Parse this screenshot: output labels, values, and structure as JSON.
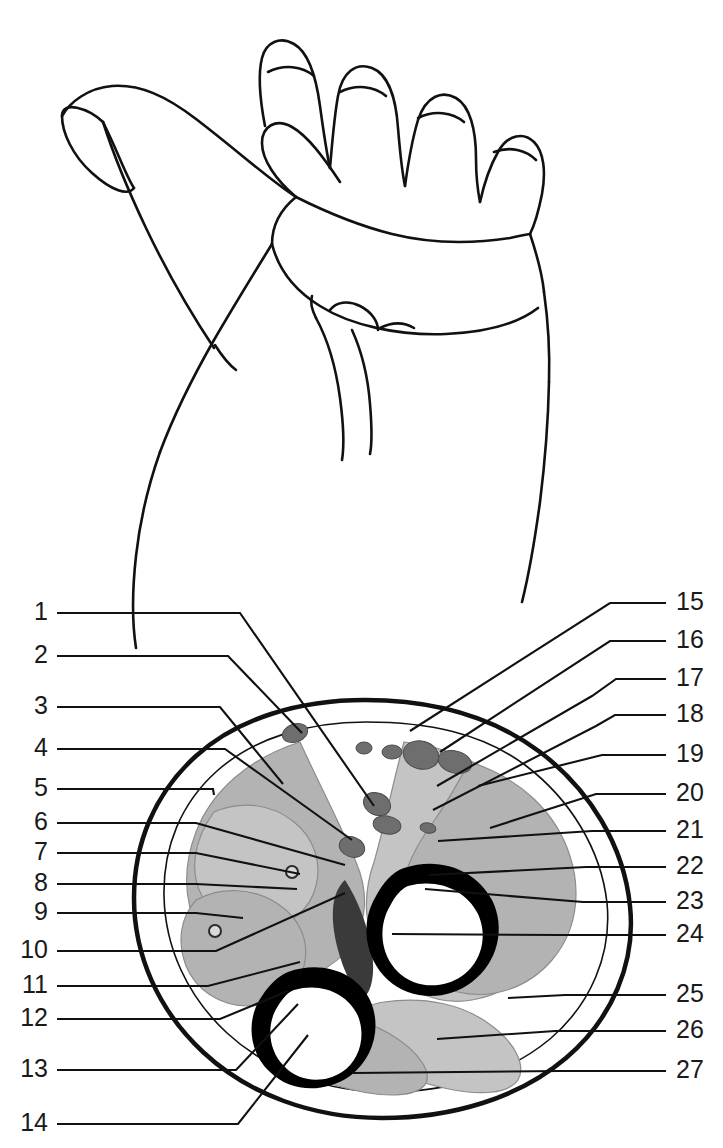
{
  "figure": {
    "view": "palmar hand and forearm with transverse section",
    "background_color": "#ffffff",
    "ink_color": "#111111",
    "muscle_fill_color": "#b3b3b3",
    "muscle_fill_light_color": "#c4c4c4",
    "vessel_fill_color": "#6e6e6e",
    "bone_cortex_color": "#000000",
    "marrow_color": "#ffffff"
  },
  "labels": {
    "left": [
      {
        "id": "1",
        "text": "1",
        "y": 620
      },
      {
        "id": "2",
        "text": "2",
        "y": 663
      },
      {
        "id": "3",
        "text": "3",
        "y": 714
      },
      {
        "id": "4",
        "text": "4",
        "y": 756
      },
      {
        "id": "5",
        "text": "5",
        "y": 796
      },
      {
        "id": "6",
        "text": "6",
        "y": 830
      },
      {
        "id": "7",
        "text": "7",
        "y": 860
      },
      {
        "id": "8",
        "text": "8",
        "y": 891
      },
      {
        "id": "9",
        "text": "9",
        "y": 920
      },
      {
        "id": "10",
        "text": "10",
        "y": 958
      },
      {
        "id": "11",
        "text": "11",
        "y": 993
      },
      {
        "id": "12",
        "text": "12",
        "y": 1026
      },
      {
        "id": "13",
        "text": "13",
        "y": 1077
      },
      {
        "id": "14",
        "text": "14",
        "y": 1131
      }
    ],
    "right": [
      {
        "id": "15",
        "text": "15",
        "y": 610
      },
      {
        "id": "16",
        "text": "16",
        "y": 648
      },
      {
        "id": "17",
        "text": "17",
        "y": 686
      },
      {
        "id": "18",
        "text": "18",
        "y": 722
      },
      {
        "id": "19",
        "text": "19",
        "y": 762
      },
      {
        "id": "20",
        "text": "20",
        "y": 801
      },
      {
        "id": "21",
        "text": "21",
        "y": 838
      },
      {
        "id": "22",
        "text": "22",
        "y": 874
      },
      {
        "id": "23",
        "text": "23",
        "y": 909
      },
      {
        "id": "24",
        "text": "24",
        "y": 942
      },
      {
        "id": "25",
        "text": "25",
        "y": 1002
      },
      {
        "id": "26",
        "text": "26",
        "y": 1038
      },
      {
        "id": "27",
        "text": "27",
        "y": 1078
      }
    ]
  },
  "leader_lines": {
    "left": [
      {
        "for": "1",
        "d": "M 57 613 L 240 613 L 374 806"
      },
      {
        "for": "2",
        "d": "M 57 656 L 228 656 L 302 733"
      },
      {
        "for": "3",
        "d": "M 57 707 L 220 707 L 283 784"
      },
      {
        "for": "4",
        "d": "M 57 749 L 225 749 L 352 840"
      },
      {
        "for": "5",
        "d": "M 57 789 L 213 789 L 214 795"
      },
      {
        "for": "6",
        "d": "M 57 823 L 196 823 L 345 865"
      },
      {
        "for": "7",
        "d": "M 57 853 L 196 853 L 300 874"
      },
      {
        "for": "8",
        "d": "M 57 884 L 196 884 L 297 889"
      },
      {
        "for": "9",
        "d": "M 57 913 L 196 913 L 243 918"
      },
      {
        "for": "10",
        "d": "M 57 951 L 216 951 L 345 893"
      },
      {
        "for": "11",
        "d": "M 57 986 L 208 986 L 300 962"
      },
      {
        "for": "12",
        "d": "M 57 1019 L 220 1019 L 288 991"
      },
      {
        "for": "13",
        "d": "M 57 1070 L 236 1070 L 298 1004"
      },
      {
        "for": "14",
        "d": "M 57 1124 L 238 1124 L 308 1035"
      }
    ],
    "right": [
      {
        "for": "15",
        "d": "M 666 603 L 610 603 L 410 731"
      },
      {
        "for": "16",
        "d": "M 666 641 L 610 641 L 440 752"
      },
      {
        "for": "17",
        "d": "M 666 679 L 616 679 L 592 696 L 437 786"
      },
      {
        "for": "18",
        "d": "M 666 715 L 615 715 L 596 726 L 433 810"
      },
      {
        "for": "19",
        "d": "M 666 755 L 602 755 L 478 786"
      },
      {
        "for": "20",
        "d": "M 666 794 L 596 794 L 490 828"
      },
      {
        "for": "21",
        "d": "M 666 831 L 592 831 L 438 841"
      },
      {
        "for": "22",
        "d": "M 666 867 L 586 867 L 429 875"
      },
      {
        "for": "23",
        "d": "M 666 902 L 583 902 L 425 889"
      },
      {
        "for": "24",
        "d": "M 666 935 L 560 935 L 392 934"
      },
      {
        "for": "25",
        "d": "M 666 995 L 565 995 L 508 998"
      },
      {
        "for": "26",
        "d": "M 666 1031 L 555 1031 L 437 1039"
      },
      {
        "for": "27",
        "d": "M 666 1071 L 560 1071 L 353 1073"
      }
    ]
  },
  "hand_outline": {
    "name": "palmar hand and forearm contour",
    "strokes": [
      "M 103 122 C 88 108 62 100 62 116 C 62 132 72 155 92 173 C 112 191 128 196 134 188",
      "M 134 188 C 126 176 118 152 103 122",
      "M 62 116 C 70 102 88 88 112 86 C 140 84 166 96 196 119 C 238 151 268 179 296 197",
      "M 296 197 C 276 180 262 160 262 143 C 262 126 276 118 292 127 C 308 136 324 158 340 182",
      "M 265 126 C 260 100 258 74 262 58 C 266 42 280 36 294 44 C 308 52 316 76 320 106 C 323 128 326 150 330 168",
      "M 268 72 C 284 64 302 66 314 76",
      "M 330 168 C 332 145 334 118 338 96 C 342 72 356 62 372 68 C 388 74 396 98 398 128 C 400 152 402 172 405 186",
      "M 340 92 C 356 84 374 86 386 96",
      "M 405 186 C 408 164 412 140 418 120 C 426 96 442 90 456 98 C 470 106 476 130 476 158 C 476 178 478 192 480 202",
      "M 418 118 C 434 110 452 112 464 122",
      "M 480 202 C 484 184 490 166 498 152 C 508 134 524 132 534 142 C 544 152 546 172 542 194 C 538 214 534 226 530 234",
      "M 494 152 C 510 146 526 150 536 160",
      "M 530 234 C 536 252 542 272 544 292",
      "M 296 197 C 330 214 360 226 392 234 C 428 243 470 244 510 238 C 520 236 528 234 530 234",
      "M 296 197 C 280 210 272 226 272 244",
      "M 272 244 C 278 268 294 290 320 306 C 350 325 398 336 446 334 C 490 332 520 322 538 308",
      "M 544 292 C 548 320 550 350 549 382",
      "M 549 382 C 548 430 544 470 540 502 C 534 546 528 578 522 602",
      "M 272 244 C 256 270 236 302 214 340 C 190 382 172 420 160 452",
      "M 160 452 C 148 486 140 520 136 556 C 132 592 132 622 136 648",
      "M 103 122 C 112 150 126 186 146 228 C 166 270 190 312 214 348",
      "M 316 318 C 328 340 336 368 340 398 C 344 428 344 448 342 460",
      "M 352 330 C 362 352 368 378 370 404 C 372 428 372 444 370 454",
      "M 316 318 C 312 310 310 302 312 296",
      "M 330 310 C 336 302 348 300 360 306 C 372 312 378 322 378 330",
      "M 380 328 C 392 322 404 322 414 328",
      "M 215 345 C 222 356 228 364 236 370"
    ]
  },
  "cross_section": {
    "skin_outline": "M 365 700 C 300 700 238 718 196 756 C 155 793 134 843 134 898 C 134 955 158 1010 203 1052 C 248 1094 312 1118 382 1118 C 452 1118 519 1098 566 1058 C 612 1019 636 963 630 906 C 624 846 590 790 540 752 C 492 716 432 700 365 700 Z",
    "fascia_outline": "M 366 722 C 308 722 254 738 217 771 C 181 803 163 847 164 896 C 165 947 187 996 227 1033 C 267 1070 325 1092 387 1092 C 449 1092 508 1074 550 1039 C 591 1004 612 954 607 903 C 601 849 570 799 525 765 C 482 733 428 722 366 722 Z",
    "muscle_compartments": [
      {
        "name": "flexor-carpi-radialis-group",
        "d": "M 300 742 C 250 758 212 790 196 832 C 183 866 184 900 198 930 C 212 958 238 976 268 980 C 300 984 334 970 352 944 C 368 920 368 890 356 862 C 344 832 322 790 300 742 Z"
      },
      {
        "name": "superficial-flexor-mass",
        "d": "M 214 812 C 242 800 272 804 294 822 C 314 838 322 862 316 886 C 310 910 290 926 264 928 C 238 930 214 918 202 896 C 190 874 192 842 214 812 Z"
      },
      {
        "name": "deep-flexor-mass",
        "d": "M 196 900 C 222 886 254 888 278 904 C 300 918 310 942 304 966 C 298 990 276 1006 248 1006 C 220 1006 196 990 186 966 C 177 942 180 918 196 900 Z"
      },
      {
        "name": "pronator-extensor-mass",
        "d": "M 404 742 C 458 748 502 772 530 810 C 556 846 564 890 552 930 C 540 968 510 994 472 1000 C 436 1006 402 990 382 960 C 364 932 362 896 374 862 C 384 828 392 786 404 742 Z"
      },
      {
        "name": "radial-extensor-group",
        "d": "M 470 762 C 520 778 556 812 570 856 C 582 894 576 932 552 960 C 528 988 492 1000 458 992 C 426 984 402 958 398 926 C 394 892 410 852 436 818 C 450 798 460 778 470 762 Z"
      },
      {
        "name": "ulnar-flexor-group",
        "d": "M 384 1002 C 424 996 464 1004 492 1026 C 516 1044 526 1066 518 1080 C 508 1094 480 1096 444 1088 C 406 1080 374 1060 360 1036 C 350 1018 358 1006 384 1002 Z"
      },
      {
        "name": "volar-superficial-band",
        "d": "M 268 1018 C 310 1008 356 1014 390 1034 C 420 1052 434 1074 424 1086 C 412 1098 378 1098 338 1086 C 300 1074 270 1054 258 1036 C 251 1025 254 1020 268 1018 Z"
      }
    ],
    "bones": [
      {
        "name": "radius",
        "cortex": "M 404 868 C 440 856 476 870 492 900 C 506 928 498 962 472 982 C 446 1002 410 1000 388 980 C 364 958 360 922 376 896 C 383 883 392 872 404 868 Z",
        "marrow": "M 408 886 C 438 878 466 890 478 914 C 488 936 482 962 462 976 C 442 990 414 988 398 972 C 380 954 378 926 390 906 C 395 896 401 889 408 886 Z"
      },
      {
        "name": "ulna",
        "cortex": "M 288 972 C 322 960 356 972 370 1000 C 382 1026 374 1058 350 1076 C 324 1094 290 1092 270 1072 C 248 1052 246 1018 262 996 C 269 985 278 976 288 972 Z",
        "marrow": "M 294 990 C 322 982 348 994 358 1016 C 366 1036 360 1060 342 1072 C 324 1084 298 1082 284 1066 C 268 1050 266 1024 278 1006 C 283 998 288 992 294 990 Z"
      }
    ],
    "vessels": [
      {
        "name": "vessel-a",
        "cx": 295,
        "cy": 733,
        "rx": 13,
        "ry": 9,
        "rot": -20
      },
      {
        "name": "vessel-b",
        "cx": 364,
        "cy": 748,
        "rx": 8,
        "ry": 6,
        "rot": 0
      },
      {
        "name": "vessel-c",
        "cx": 392,
        "cy": 752,
        "rx": 10,
        "ry": 7,
        "rot": 0
      },
      {
        "name": "vessel-d",
        "cx": 421,
        "cy": 755,
        "rx": 18,
        "ry": 14,
        "rot": 15
      },
      {
        "name": "vessel-e",
        "cx": 455,
        "cy": 762,
        "rx": 17,
        "ry": 11,
        "rot": 15
      },
      {
        "name": "vessel-f",
        "cx": 377,
        "cy": 804,
        "rx": 14,
        "ry": 11,
        "rot": 25
      },
      {
        "name": "vessel-g",
        "cx": 387,
        "cy": 825,
        "rx": 14,
        "ry": 9,
        "rot": 10
      },
      {
        "name": "vessel-h",
        "cx": 352,
        "cy": 847,
        "rx": 13,
        "ry": 10,
        "rot": 20
      },
      {
        "name": "vessel-i",
        "cx": 428,
        "cy": 828,
        "rx": 8,
        "ry": 5,
        "rot": 10
      }
    ],
    "small_vessels": [
      {
        "name": "small-vessel-left-1",
        "cx": 292,
        "cy": 872,
        "r": 6
      },
      {
        "name": "small-vessel-left-2",
        "cx": 215,
        "cy": 931,
        "r": 6
      }
    ],
    "interosseous_band": "M 345 880 C 358 900 368 926 372 952 C 375 974 372 990 364 998 C 352 990 342 968 336 942 C 330 914 332 892 345 880 Z"
  }
}
